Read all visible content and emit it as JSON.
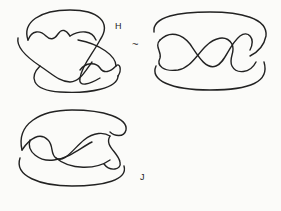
{
  "figure": {
    "diagrams": [
      {
        "id": "knot-H",
        "label": "H"
      },
      {
        "id": "knot-middle",
        "label": ""
      },
      {
        "id": "knot-J",
        "label": "J"
      }
    ],
    "equivalence_symbol": "~"
  }
}
